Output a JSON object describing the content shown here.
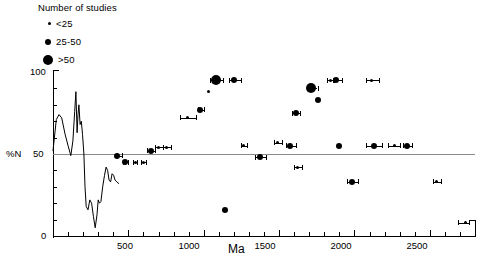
{
  "legend": {
    "title": "Number of studies",
    "items": [
      {
        "label": "<25",
        "marker": "small-dot",
        "size_px": 3
      },
      {
        "label": "25-50",
        "marker": "medium-dot",
        "size_px": 6
      },
      {
        "label": ">50",
        "marker": "large-dot",
        "size_px": 10
      }
    ]
  },
  "axes": {
    "y": {
      "label": "%N",
      "ticks": [
        0,
        50,
        100
      ],
      "labeled_ticks": [
        "0",
        "50",
        "100"
      ],
      "min": 0,
      "max": 100,
      "minor_tick_step": 10
    },
    "x": {
      "title": "Ma",
      "ticks": [
        500,
        1000,
        1500,
        2000,
        2500
      ],
      "labeled_ticks": [
        "500",
        "1000",
        "1500",
        "2000",
        "2500"
      ],
      "min": 0,
      "max": 2800,
      "minor_tick_step": 100
    }
  },
  "reference_line": {
    "value": 50,
    "color": "#8a8a8a"
  },
  "chart_data": {
    "type": "scatter",
    "title": "",
    "xlabel": "Ma",
    "ylabel": "%N",
    "xlim": [
      0,
      2800
    ],
    "ylim": [
      0,
      100
    ],
    "grid": false,
    "legend_position": "top-left",
    "legend_title": "Number of studies",
    "size_encoding": [
      {
        "label": "<25",
        "diameter_px": 3
      },
      {
        "label": "25-50",
        "diameter_px": 6
      },
      {
        "label": ">50",
        "diameter_px": 10
      }
    ],
    "series": [
      {
        "name": "line-curve",
        "type": "line",
        "comment": "continuous %N curve over 0-460 Ma",
        "points": [
          {
            "x": 0,
            "y": 52
          },
          {
            "x": 22,
            "y": 71
          },
          {
            "x": 40,
            "y": 74
          },
          {
            "x": 58,
            "y": 72
          },
          {
            "x": 80,
            "y": 62
          },
          {
            "x": 100,
            "y": 55
          },
          {
            "x": 118,
            "y": 49
          },
          {
            "x": 132,
            "y": 58
          },
          {
            "x": 144,
            "y": 76
          },
          {
            "x": 152,
            "y": 88
          },
          {
            "x": 160,
            "y": 63
          },
          {
            "x": 166,
            "y": 74
          },
          {
            "x": 172,
            "y": 80
          },
          {
            "x": 180,
            "y": 68
          },
          {
            "x": 188,
            "y": 70
          },
          {
            "x": 196,
            "y": 62
          },
          {
            "x": 205,
            "y": 50
          },
          {
            "x": 212,
            "y": 30
          },
          {
            "x": 220,
            "y": 18
          },
          {
            "x": 232,
            "y": 16
          },
          {
            "x": 244,
            "y": 22
          },
          {
            "x": 256,
            "y": 20
          },
          {
            "x": 268,
            "y": 12
          },
          {
            "x": 280,
            "y": 5
          },
          {
            "x": 292,
            "y": 13
          },
          {
            "x": 300,
            "y": 22
          },
          {
            "x": 308,
            "y": 20
          },
          {
            "x": 318,
            "y": 21
          },
          {
            "x": 330,
            "y": 30
          },
          {
            "x": 342,
            "y": 37
          },
          {
            "x": 352,
            "y": 42
          },
          {
            "x": 362,
            "y": 40
          },
          {
            "x": 372,
            "y": 34
          },
          {
            "x": 382,
            "y": 33
          },
          {
            "x": 392,
            "y": 38
          },
          {
            "x": 402,
            "y": 37
          },
          {
            "x": 412,
            "y": 34
          },
          {
            "x": 424,
            "y": 33
          },
          {
            "x": 436,
            "y": 32
          }
        ]
      },
      {
        "name": "studies",
        "type": "scatter",
        "points": [
          {
            "x": 425,
            "y": 49,
            "size": "25-50",
            "err_lo": 425,
            "err_hi": 455
          },
          {
            "x": 480,
            "y": 45,
            "size": "25-50",
            "err_lo": 465,
            "err_hi": 495
          },
          {
            "x": 545,
            "y": 45,
            "size": "<25",
            "err_lo": 530,
            "err_hi": 560
          },
          {
            "x": 600,
            "y": 45,
            "size": "<25",
            "err_lo": 585,
            "err_hi": 615
          },
          {
            "x": 650,
            "y": 52,
            "size": "25-50",
            "err_lo": 625,
            "err_hi": 680
          },
          {
            "x": 700,
            "y": 54,
            "size": "<25",
            "err_lo": 680,
            "err_hi": 730
          },
          {
            "x": 755,
            "y": 54,
            "size": "<25",
            "err_lo": 730,
            "err_hi": 780
          },
          {
            "x": 890,
            "y": 72,
            "size": "<25",
            "err_lo": 840,
            "err_hi": 950
          },
          {
            "x": 975,
            "y": 77,
            "size": "25-50",
            "err_lo": 960,
            "err_hi": 1000
          },
          {
            "x": 1035,
            "y": 88,
            "size": "<25",
            "err_lo": 1035,
            "err_hi": 1035
          },
          {
            "x": 1080,
            "y": 95,
            "size": ">50",
            "err_lo": 1040,
            "err_hi": 1125
          },
          {
            "x": 1200,
            "y": 95,
            "size": "25-50",
            "err_lo": 1165,
            "err_hi": 1245
          },
          {
            "x": 1140,
            "y": 16,
            "size": "25-50",
            "err_lo": 1140,
            "err_hi": 1140
          },
          {
            "x": 1265,
            "y": 55,
            "size": "<25",
            "err_lo": 1245,
            "err_hi": 1290
          },
          {
            "x": 1375,
            "y": 48,
            "size": "25-50",
            "err_lo": 1340,
            "err_hi": 1415
          },
          {
            "x": 1490,
            "y": 57,
            "size": "<25",
            "err_lo": 1465,
            "err_hi": 1520
          },
          {
            "x": 1575,
            "y": 55,
            "size": "25-50",
            "err_lo": 1545,
            "err_hi": 1610
          },
          {
            "x": 1610,
            "y": 75,
            "size": "25-50",
            "err_lo": 1585,
            "err_hi": 1640
          },
          {
            "x": 1625,
            "y": 42,
            "size": "<25",
            "err_lo": 1600,
            "err_hi": 1655
          },
          {
            "x": 1715,
            "y": 90,
            "size": ">50",
            "err_lo": 1690,
            "err_hi": 1755
          },
          {
            "x": 1760,
            "y": 83,
            "size": "25-50",
            "err_lo": 1760,
            "err_hi": 1760
          },
          {
            "x": 1840,
            "y": 95,
            "size": "<25",
            "err_lo": 1820,
            "err_hi": 1860
          },
          {
            "x": 1880,
            "y": 95,
            "size": "25-50",
            "err_lo": 1865,
            "err_hi": 1915
          },
          {
            "x": 1900,
            "y": 55,
            "size": "25-50",
            "err_lo": 1900,
            "err_hi": 1900
          },
          {
            "x": 1985,
            "y": 33,
            "size": "25-50",
            "err_lo": 1950,
            "err_hi": 2025
          },
          {
            "x": 2115,
            "y": 95,
            "size": "<25",
            "err_lo": 2075,
            "err_hi": 2160
          },
          {
            "x": 2130,
            "y": 55,
            "size": "25-50",
            "err_lo": 2075,
            "err_hi": 2185
          },
          {
            "x": 2265,
            "y": 55,
            "size": "<25",
            "err_lo": 2225,
            "err_hi": 2305
          },
          {
            "x": 2350,
            "y": 55,
            "size": "25-50",
            "err_lo": 2320,
            "err_hi": 2380
          },
          {
            "x": 2545,
            "y": 33,
            "size": "<25",
            "err_lo": 2520,
            "err_hi": 2575
          },
          {
            "x": 2735,
            "y": 8,
            "size": "<25",
            "err_lo": 2690,
            "err_hi": 2760
          }
        ]
      }
    ]
  }
}
